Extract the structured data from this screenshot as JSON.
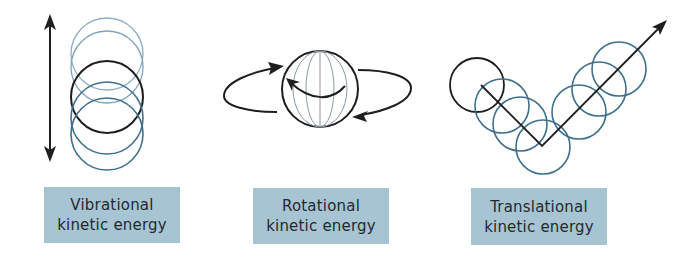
{
  "colors": {
    "label_background": "#a7c4d2",
    "label_text": "#1f2a30",
    "dark_stroke": "#1e1e1e",
    "blue_stroke": "#3f6f8c",
    "faint_blue_stroke": "#7fa3ba",
    "meridian_stroke": "#8a9aa3"
  },
  "panels": [
    {
      "id": "vibrational",
      "label_line1": "Vibrational",
      "label_line2": "kinetic energy",
      "icons": [
        "double-headed-vertical-arrow-icon",
        "stacked-oscillating-circles-icon"
      ]
    },
    {
      "id": "rotational",
      "label_line1": "Rotational",
      "label_line2": "kinetic energy",
      "icons": [
        "rotating-sphere-icon",
        "circular-rotation-arrows-icon"
      ]
    },
    {
      "id": "translational",
      "label_line1": "Translational",
      "label_line2": "kinetic energy",
      "icons": [
        "moving-circles-path-icon",
        "direction-arrow-icon"
      ]
    }
  ]
}
